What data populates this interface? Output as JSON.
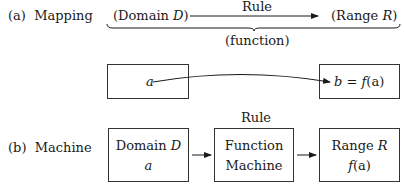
{
  "panel_a": {
    "label": "(a)",
    "title": "Mapping",
    "top_row": {
      "domain_open": "(Domain ",
      "domain_var": "D",
      "domain_close": ")",
      "rule_label": "Rule",
      "range_open": "(Range ",
      "range_var": "R",
      "range_close": ")"
    },
    "brace_label": "(function)",
    "left_box": {
      "element": "a"
    },
    "right_box": {
      "lhs": "b",
      "eq": " = ",
      "rhs_f": "f",
      "rhs_arg": "(a)"
    }
  },
  "panel_b": {
    "label": "(b)",
    "title": "Machine",
    "rule_label": "Rule",
    "domain_box": {
      "line1": "Domain ",
      "line1_var": "D",
      "line2": "a"
    },
    "function_box": {
      "line1": "Function",
      "line2": "Machine"
    },
    "range_box": {
      "line1": "Range ",
      "line1_var": "R",
      "line2_f": "f",
      "line2_arg": "(a)"
    }
  }
}
